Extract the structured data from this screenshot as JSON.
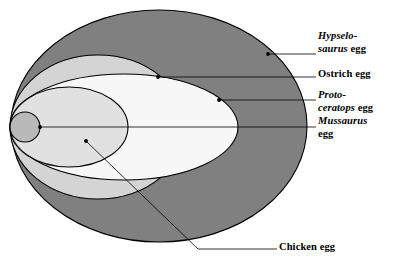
{
  "figure": {
    "type": "nested-ellipse-size-comparison",
    "background_color": "#ffffff",
    "line_color": "#000000"
  },
  "eggs": [
    {
      "key": "hypselosaurus",
      "name_italic": "Hypselo-",
      "name_italic_line2": "saurus",
      "name_roman": "egg",
      "fill": "#808080",
      "ellipse": {
        "cx": 159,
        "cy": 126,
        "rx": 148,
        "ry": 116
      },
      "dot": {
        "x": 268,
        "y": 54
      },
      "leader": {
        "x1": 268,
        "y1": 54,
        "x2": 316,
        "y2": 54
      }
    },
    {
      "key": "ostrich",
      "name_italic": "",
      "name_roman": "Ostrich egg",
      "fill": "#d4d4d4",
      "ellipse": {
        "cx": 98,
        "cy": 127,
        "rx": 88,
        "ry": 72
      },
      "dot": {
        "x": 158,
        "y": 77
      },
      "leader": {
        "x1": 158,
        "y1": 77,
        "x2": 316,
        "y2": 77
      }
    },
    {
      "key": "protoceratops",
      "name_italic": "Proto-",
      "name_italic_line2": "ceratops",
      "name_roman": "egg",
      "fill": "#f7f7f7",
      "ellipse": {
        "cx": 124,
        "cy": 127,
        "rx": 114,
        "ry": 53
      },
      "dot": {
        "x": 219,
        "y": 100
      },
      "leader": {
        "x1": 219,
        "y1": 100,
        "x2": 316,
        "y2": 100
      }
    },
    {
      "key": "mussaurus",
      "name_italic": "Mussaurus",
      "name_roman": "egg",
      "fill": "#c8c8c8",
      "ellipse": {
        "cx": 25,
        "cy": 127,
        "rx": 15,
        "ry": 15
      },
      "dot": {
        "x": 40,
        "y": 127
      },
      "leader": {
        "x1": 40,
        "y1": 127,
        "x2": 316,
        "y2": 127
      }
    },
    {
      "key": "chicken",
      "name_italic": "",
      "name_roman": "Chicken egg",
      "fill": "none",
      "ellipse": {
        "cx": 69,
        "cy": 127,
        "rx": 59,
        "ry": 40
      },
      "dot": {
        "x": 86,
        "y": 141
      },
      "leader_bend": {
        "x1": 86,
        "y1": 141,
        "x2": 198,
        "y2": 249,
        "x3": 277,
        "y3": 249
      }
    }
  ],
  "labels": {
    "hypselosaurus": {
      "line1_italic": "Hypselo-",
      "line2_italic": "saurus",
      "line2_roman": " egg"
    },
    "ostrich": {
      "line1_roman": "Ostrich egg"
    },
    "protoceratops": {
      "line1_italic": "Proto-",
      "line2_italic": "ceratops",
      "line2_roman": " egg"
    },
    "mussaurus": {
      "line1_italic": "Mussaurus",
      "line2_roman": "egg"
    },
    "chicken": {
      "line1_roman": "Chicken egg"
    }
  }
}
